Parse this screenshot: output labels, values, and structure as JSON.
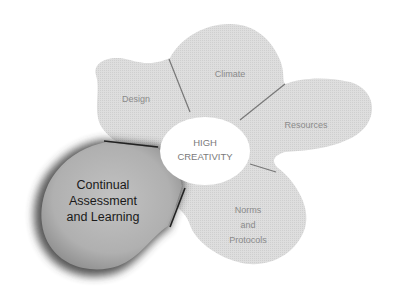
{
  "diagram": {
    "center": {
      "line1": "HIGH",
      "line2": "CREATIVITY"
    },
    "petals": [
      {
        "id": "design",
        "label": "Design"
      },
      {
        "id": "climate",
        "label": "Climate"
      },
      {
        "id": "resources",
        "label": "Resources"
      },
      {
        "id": "norms",
        "line1": "Norms",
        "line2": "and",
        "line3": "Protocols"
      }
    ],
    "highlighted": {
      "line1": "Continual",
      "line2": "Assessment",
      "line3": "and Learning"
    },
    "colors": {
      "petal_fill": "#dcdcdc",
      "highlight_fill": "#b4b4b4",
      "highlight_edge": "#5a5a5a",
      "divider": "#777777",
      "center_fill": "#ffffff"
    }
  }
}
